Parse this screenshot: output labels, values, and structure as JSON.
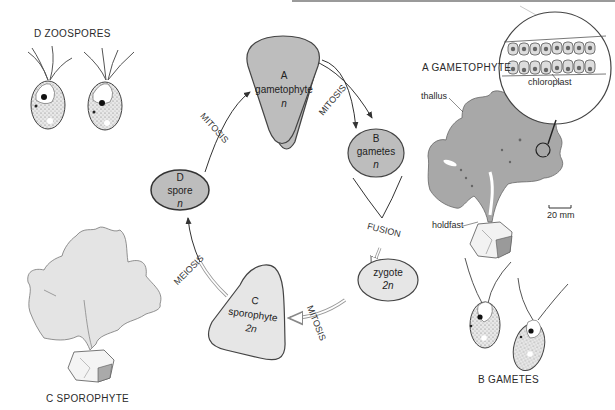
{
  "header": {
    "rule_color": "#9a9a9a"
  },
  "cycle": {
    "nodes": {
      "A": {
        "letter": "A",
        "name": "gametophyte",
        "ploidy": "n",
        "fill": "#bdbdbd"
      },
      "B": {
        "letter": "B",
        "name": "gametes",
        "ploidy": "n",
        "fill": "#bdbdbd"
      },
      "C": {
        "letter": "C",
        "name": "sporophyte",
        "ploidy": "2n",
        "fill": "#e6e6e6"
      },
      "D": {
        "letter": "D",
        "name": "spore",
        "ploidy": "n",
        "fill": "#bdbdbd"
      },
      "Z": {
        "name": "zygote",
        "ploidy": "2n",
        "fill": "#e6e6e6"
      }
    },
    "processes": {
      "d_to_a": "MITOSIS",
      "a_to_b": "MITOSIS",
      "b_to_z": "FUSION",
      "z_to_c": "MITOSIS",
      "c_to_d": "MEIOSIS"
    }
  },
  "illustrations": {
    "zoospores": {
      "title": "D ZOOSPORES"
    },
    "gametophyte": {
      "title": "A GAMETOPHYTE",
      "labels": {
        "thallus": "thallus",
        "holdfast": "holdfast",
        "chloroplast": "chloroplast",
        "scale": "20 mm"
      }
    },
    "gametes": {
      "title": "B GAMETES"
    },
    "sporophyte": {
      "title": "C SPOROPHYTE"
    }
  },
  "colors": {
    "haploid_fill": "#bdbdbd",
    "diploid_fill": "#e6e6e6",
    "thallus_gametophyte": "#a8a8a8",
    "thallus_sporophyte": "#e4e4e4",
    "outline": "#444444"
  }
}
